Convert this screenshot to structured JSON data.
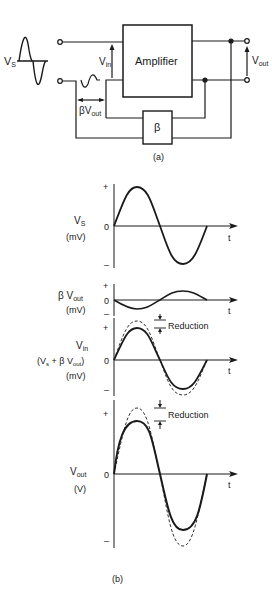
{
  "figure_a": {
    "caption": "(a)",
    "source_label": "V",
    "source_sub": "S",
    "amplifier_label": "Amplifier",
    "beta_label": "β",
    "vin_label": "V",
    "vin_sub": "in",
    "vout_label": "V",
    "vout_sub": "out",
    "feedback_label": "βV",
    "feedback_sub": "out"
  },
  "figure_b": {
    "caption": "(b)",
    "plots": [
      {
        "id": "vs",
        "label_main": "V",
        "label_sub": "S",
        "unit": "(mV)",
        "plus": "+",
        "zero": "0",
        "minus": "–",
        "t": "t"
      },
      {
        "id": "bvout",
        "label_main": "β V",
        "label_sub": "out",
        "unit": "(mV)",
        "plus": "+",
        "zero": "0",
        "minus": "–",
        "t": "t"
      },
      {
        "id": "vin",
        "label_main": "V",
        "label_sub": "in",
        "formula_a": "(V",
        "formula_s": "s",
        "formula_b": " + β V",
        "formula_out": "out",
        "formula_c": ")",
        "unit": "(mV)",
        "plus": "+",
        "zero": "0",
        "minus": "–",
        "t": "t",
        "annotation": "Reduction"
      },
      {
        "id": "vout",
        "label_main": "V",
        "label_sub": "out",
        "unit": "(V)",
        "plus": "+",
        "zero": "0",
        "minus": "–",
        "t": "t",
        "annotation": "Reduction"
      }
    ]
  },
  "colors": {
    "ink": "#1a1a1a",
    "background": "#ffffff"
  }
}
